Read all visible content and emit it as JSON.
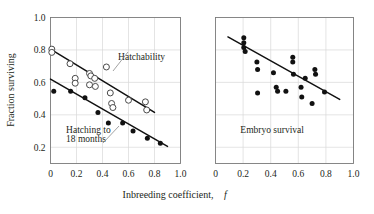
{
  "figure": {
    "y_axis_title": "Fraction surviving",
    "x_axis_title": "Inbreeding coefficient,",
    "x_axis_title_symbol": "f"
  },
  "chart_data": [
    {
      "type": "scatter",
      "panel": "left",
      "title": "",
      "xlabel": "Inbreeding coefficient, f",
      "ylabel": "Fraction surviving",
      "xlim": [
        0,
        1.0
      ],
      "ylim": [
        0.1,
        1.0
      ],
      "xticks": [
        0,
        0.2,
        0.4,
        0.6,
        0.8,
        1.0
      ],
      "xtick_labels": [
        "0",
        "0.2",
        "0.4",
        "0.6",
        "0.8",
        "1.0"
      ],
      "yticks": [
        0.2,
        0.4,
        0.6,
        0.8,
        1.0
      ],
      "ytick_labels": [
        "0.2",
        "0.4",
        "0.6",
        "0.8",
        "1.0"
      ],
      "grid": true,
      "legend_position": "inline-annotation",
      "annotations": [
        {
          "text": "Hatchability",
          "x": 0.52,
          "y": 0.74
        },
        {
          "text": "Hatching to",
          "x": 0.12,
          "y": 0.285
        },
        {
          "text": "18 months",
          "x": 0.12,
          "y": 0.235
        }
      ],
      "series": [
        {
          "name": "Hatchability",
          "marker": "open-circle",
          "points": [
            {
              "x": 0.01,
              "y": 0.805
            },
            {
              "x": 0.01,
              "y": 0.785
            },
            {
              "x": 0.15,
              "y": 0.715
            },
            {
              "x": 0.19,
              "y": 0.625
            },
            {
              "x": 0.19,
              "y": 0.595
            },
            {
              "x": 0.3,
              "y": 0.655
            },
            {
              "x": 0.31,
              "y": 0.64
            },
            {
              "x": 0.34,
              "y": 0.625
            },
            {
              "x": 0.3,
              "y": 0.585
            },
            {
              "x": 0.345,
              "y": 0.575
            },
            {
              "x": 0.43,
              "y": 0.695
            },
            {
              "x": 0.46,
              "y": 0.535
            },
            {
              "x": 0.47,
              "y": 0.47
            },
            {
              "x": 0.48,
              "y": 0.445
            },
            {
              "x": 0.6,
              "y": 0.49
            },
            {
              "x": 0.73,
              "y": 0.48
            },
            {
              "x": 0.74,
              "y": 0.43
            }
          ],
          "trendline": {
            "x0": 0.0,
            "y0": 0.805,
            "x1": 0.8,
            "y1": 0.415
          }
        },
        {
          "name": "Hatching to 18 months",
          "marker": "filled-circle",
          "points": [
            {
              "x": 0.025,
              "y": 0.545
            },
            {
              "x": 0.155,
              "y": 0.545
            },
            {
              "x": 0.265,
              "y": 0.505
            },
            {
              "x": 0.365,
              "y": 0.415
            },
            {
              "x": 0.445,
              "y": 0.35
            },
            {
              "x": 0.555,
              "y": 0.35
            },
            {
              "x": 0.635,
              "y": 0.3
            },
            {
              "x": 0.745,
              "y": 0.255
            },
            {
              "x": 0.845,
              "y": 0.225
            }
          ],
          "trendline": {
            "x0": 0.0,
            "y0": 0.62,
            "x1": 0.9,
            "y1": 0.205
          }
        }
      ]
    },
    {
      "type": "scatter",
      "panel": "right",
      "title": "",
      "xlabel": "Inbreeding coefficient, f",
      "ylabel": "",
      "xlim": [
        0,
        1.0
      ],
      "ylim": [
        0.1,
        1.0
      ],
      "xticks": [
        0,
        0.2,
        0.4,
        0.6,
        0.8,
        1.0
      ],
      "xtick_labels": [
        "0",
        "0.2",
        "0.4",
        "0.6",
        "0.8",
        "1.0"
      ],
      "yticks": [
        0.2,
        0.4,
        0.6,
        0.8,
        1.0
      ],
      "ytick_labels": [],
      "grid": true,
      "legend_position": "inline-annotation",
      "annotations": [
        {
          "text": "Embryo survival",
          "x": 0.18,
          "y": 0.29
        }
      ],
      "series": [
        {
          "name": "Embryo survival",
          "marker": "filled-circle",
          "points": [
            {
              "x": 0.205,
              "y": 0.875
            },
            {
              "x": 0.205,
              "y": 0.845
            },
            {
              "x": 0.205,
              "y": 0.815
            },
            {
              "x": 0.215,
              "y": 0.79
            },
            {
              "x": 0.3,
              "y": 0.725
            },
            {
              "x": 0.305,
              "y": 0.68
            },
            {
              "x": 0.42,
              "y": 0.66
            },
            {
              "x": 0.305,
              "y": 0.535
            },
            {
              "x": 0.44,
              "y": 0.57
            },
            {
              "x": 0.45,
              "y": 0.545
            },
            {
              "x": 0.56,
              "y": 0.755
            },
            {
              "x": 0.56,
              "y": 0.725
            },
            {
              "x": 0.565,
              "y": 0.65
            },
            {
              "x": 0.65,
              "y": 0.625
            },
            {
              "x": 0.72,
              "y": 0.68
            },
            {
              "x": 0.725,
              "y": 0.65
            },
            {
              "x": 0.51,
              "y": 0.545
            },
            {
              "x": 0.62,
              "y": 0.57
            },
            {
              "x": 0.625,
              "y": 0.51
            },
            {
              "x": 0.79,
              "y": 0.54
            },
            {
              "x": 0.7,
              "y": 0.47
            }
          ],
          "trendline": {
            "x0": 0.09,
            "y0": 0.88,
            "x1": 0.9,
            "y1": 0.495
          }
        }
      ]
    }
  ]
}
